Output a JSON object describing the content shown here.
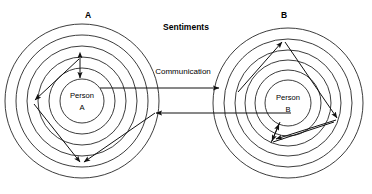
{
  "diagram": {
    "title": "Sentiments",
    "communication_label": "Communication",
    "groups": [
      {
        "id": "A",
        "label": "A",
        "center_label_line1": "Person",
        "center_label_line2": "A",
        "center_x": 82,
        "center_y": 101,
        "ring_radii": [
          77,
          66,
          55,
          44,
          33,
          22
        ],
        "label_x": 88,
        "label_y": 15
      },
      {
        "id": "B",
        "label": "B",
        "center_label_line1": "Person",
        "center_label_line2": "B",
        "center_x": 288,
        "center_y": 103,
        "ring_radii": [
          75,
          64,
          53,
          43,
          33,
          23
        ],
        "label_x": 284,
        "label_y": 15
      }
    ],
    "title_x": 186,
    "title_y": 27,
    "communication_x": 183,
    "communication_y": 72,
    "arrows": {
      "communication_forward": {
        "name": "communication-arrow-a-to-b",
        "x1": 100,
        "y1": 88,
        "x2": 219,
        "y2": 88,
        "direction": "right"
      },
      "communication_back": {
        "name": "communication-arrow-b-to-a",
        "x1": 291,
        "y1": 113,
        "x2": 155,
        "y2": 113,
        "direction": "left"
      },
      "group_a_internal": [
        {
          "name": "sentiment-arrow-a-vertical",
          "points": "80,58 80,78",
          "heads": "both"
        },
        {
          "name": "sentiment-arrow-a-upper-left",
          "points": "79,59 34,101",
          "heads": "end"
        },
        {
          "name": "sentiment-arrow-a-lower-left",
          "points": "34,103 81,163",
          "heads": "end"
        },
        {
          "name": "sentiment-arrow-a-lower-right",
          "points": "155,113 83,163",
          "heads": "end"
        }
      ],
      "group_b_internal": [
        {
          "name": "sentiment-arrow-b-up-left",
          "points": "240,91 283,41",
          "heads": "end"
        },
        {
          "name": "sentiment-arrow-b-up-right",
          "points": "336,119 284,41",
          "heads": "start"
        },
        {
          "name": "sentiment-arrow-b-down-right",
          "points": "285,42 337,119",
          "heads": "end"
        },
        {
          "name": "sentiment-arrow-b-lower-left",
          "points": "336,121 274,140",
          "heads": "end"
        },
        {
          "name": "sentiment-arrow-b-zigzag",
          "points": "272,141 333,122",
          "heads": "none"
        },
        {
          "name": "sentiment-arrow-b-inner-up",
          "points": "272,142 279,123",
          "heads": "end"
        }
      ]
    },
    "colors": {
      "stroke": "#1a1a1a",
      "text": "#000000",
      "background": "#ffffff"
    }
  }
}
